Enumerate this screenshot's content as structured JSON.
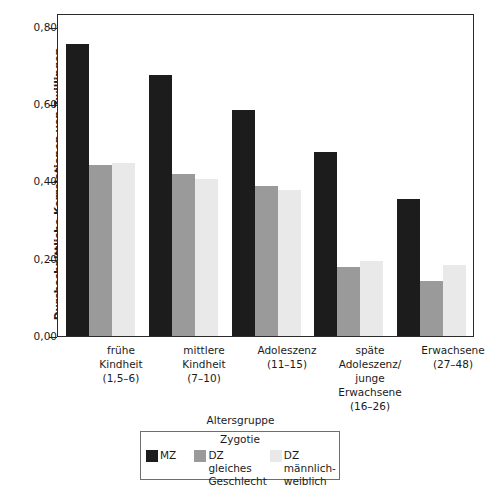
{
  "chart_data": {
    "type": "bar",
    "title": "",
    "xlabel": "Altersgruppe",
    "ylabel": "Durchschnittliche Korrelationen von Zwillingen",
    "ylim": [
      0.0,
      0.88
    ],
    "ytick_values": [
      0.0,
      0.2,
      0.4,
      0.6,
      0.8
    ],
    "ytick_labels": [
      "0,00",
      "0,20",
      "0,40",
      "0,60",
      "0,80"
    ],
    "grid": false,
    "legend_position": "bottom",
    "legend_title": "Zygotie",
    "categories": [
      "frühe Kindheit (1,5–6)",
      "mittlere Kindheit (7–10)",
      "Adoleszenz (11–15)",
      "späte Adoleszenz/ junge Erwachsene (16–26)",
      "Erwachsene (27–48)"
    ],
    "category_lines": [
      [
        "frühe",
        "Kindheit",
        "(1,5–6)"
      ],
      [
        "mittlere",
        "Kindheit",
        "(7–10)"
      ],
      [
        "Adoleszenz",
        "(11–15)"
      ],
      [
        "späte",
        "Adoleszenz/",
        "junge",
        "Erwachsene",
        "(16–26)"
      ],
      [
        "Erwachsene",
        "(27–48)"
      ]
    ],
    "series": [
      {
        "name": "MZ",
        "color": "#1c1c1c",
        "values": [
          0.8,
          0.715,
          0.62,
          0.505,
          0.375
        ]
      },
      {
        "name": "DZ gleiches Geschlecht",
        "color": "#9a9a9a",
        "values": [
          0.47,
          0.445,
          0.41,
          0.19,
          0.15
        ]
      },
      {
        "name": "DZ männlich-weiblich",
        "color": "#e9e9e9",
        "values": [
          0.475,
          0.43,
          0.4,
          0.205,
          0.195
        ]
      }
    ]
  },
  "legend": {
    "title": "Zygotie",
    "entries": [
      {
        "label_lines": [
          "MZ"
        ],
        "swatch": "mz"
      },
      {
        "label_lines": [
          "DZ gleiches",
          "Geschlecht"
        ],
        "swatch": "dz-same"
      },
      {
        "label_lines": [
          "DZ männlich-",
          "weiblich"
        ],
        "swatch": "dz-mf"
      }
    ]
  },
  "legend_flat": {
    "item0_line0": "MZ",
    "item1_line0": "DZ gleiches",
    "item1_line1": "Geschlecht",
    "item2_line0": "DZ männlich-",
    "item2_line1": "weiblich"
  },
  "axes": {
    "y_title": "Durchschnittliche Korrelationen von Zwillingen",
    "x_title": "Altersgruppe",
    "ytick_0": "0,00",
    "ytick_1": "0,20",
    "ytick_2": "0,40",
    "ytick_3": "0,60",
    "ytick_4": "0,80"
  },
  "xcats": {
    "g0_l0": "frühe",
    "g0_l1": "Kindheit",
    "g0_l2": "(1,5–6)",
    "g1_l0": "mittlere",
    "g1_l1": "Kindheit",
    "g1_l2": "(7–10)",
    "g2_l0": "Adoleszenz",
    "g2_l1": "(11–15)",
    "g3_l0": "späte",
    "g3_l1": "Adoleszenz/",
    "g3_l2": "junge",
    "g3_l3": "Erwachsene",
    "g3_l4": "(16–26)",
    "g4_l0": "Erwachsene",
    "g4_l1": "(27–48)"
  },
  "colors": {
    "mz": "#1c1c1c",
    "dz_same": "#9a9a9a",
    "dz_mf": "#e9e9e9",
    "axis": "#2b2b2b",
    "background": "#ffffff"
  }
}
